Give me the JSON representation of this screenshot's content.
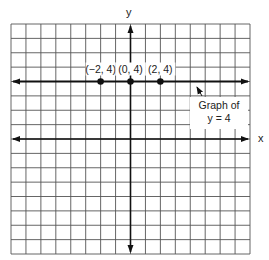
{
  "chart_data": {
    "type": "line",
    "title": "",
    "xlabel": "x",
    "ylabel": "y",
    "xlim": [
      -8,
      8
    ],
    "ylim": [
      -8,
      8
    ],
    "grid": true,
    "series": [
      {
        "name": "y = 4",
        "equation": "y = 4",
        "kind": "horizontal-line",
        "y": 4,
        "arrows": "both"
      }
    ],
    "points": [
      {
        "x": -2,
        "y": 4,
        "label": "(−2, 4)"
      },
      {
        "x": 0,
        "y": 4,
        "label": "(0, 4)"
      },
      {
        "x": 2,
        "y": 4,
        "label": "(2, 4)"
      }
    ],
    "annotation": {
      "line1": "Graph of",
      "line2": "y = 4",
      "points_to": "line y = 4"
    },
    "colors": {
      "grid": "#555555",
      "axes": "#111111",
      "line": "#111111",
      "points": "#111111"
    }
  }
}
